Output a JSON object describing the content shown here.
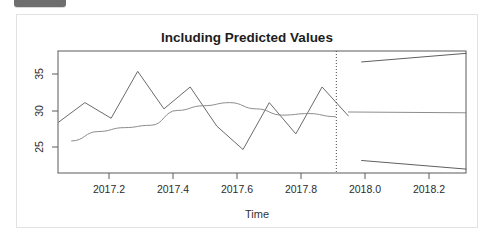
{
  "window": {
    "tab_fragment_color": "#6e6e6e",
    "card_background": "#ffffff",
    "card_border_color": "#e2e2e2"
  },
  "chart_data": {
    "type": "line",
    "title": "Including Predicted Values",
    "xlabel": "Time",
    "ylabel": "",
    "xlim": [
      2017.04,
      2018.33
    ],
    "ylim": [
      22.0,
      37.6
    ],
    "grid": false,
    "legend": false,
    "xticks": [
      2017.2,
      2017.4,
      2017.6,
      2017.8,
      2018.0,
      2018.2
    ],
    "xtick_labels": [
      "2017.2",
      "2017.4",
      "2017.6",
      "2017.8",
      "2018.0",
      "2018.2"
    ],
    "yticks": [
      25,
      30,
      35
    ],
    "ytick_labels": [
      "25",
      "30",
      "35"
    ],
    "forecast_start": 2017.92,
    "annotations": [
      {
        "name": "forecast-divider",
        "type": "vline",
        "x": 2017.92,
        "style": "dotted"
      }
    ],
    "series": [
      {
        "name": "observed",
        "style": "jagged-line",
        "x": [
          2017.042,
          2017.125,
          2017.208,
          2017.292,
          2017.375,
          2017.458,
          2017.542,
          2017.625,
          2017.708,
          2017.792,
          2017.875,
          2017.958
        ],
        "values": [
          28.5,
          31.0,
          29.0,
          35.0,
          30.2,
          33.0,
          28.0,
          25.0,
          31.0,
          27.0,
          33.0,
          29.3
        ]
      },
      {
        "name": "fitted",
        "style": "smooth-line",
        "x": [
          2017.083,
          2017.167,
          2017.25,
          2017.333,
          2017.417,
          2017.5,
          2017.583,
          2017.667,
          2017.75,
          2017.833,
          2017.917
        ],
        "values": [
          26.1,
          27.3,
          27.8,
          28.1,
          30.0,
          30.6,
          31.0,
          30.2,
          29.4,
          29.6,
          29.2
        ]
      },
      {
        "name": "forecast-mean",
        "style": "flat-line",
        "x": [
          2017.958,
          2018.33
        ],
        "values": [
          29.8,
          29.7
        ]
      },
      {
        "name": "upper-bound",
        "style": "line",
        "x": [
          2018.0,
          2018.33
        ],
        "values": [
          36.2,
          37.3
        ]
      },
      {
        "name": "lower-bound",
        "style": "line",
        "x": [
          2018.0,
          2018.33
        ],
        "values": [
          23.6,
          22.5
        ]
      }
    ]
  }
}
